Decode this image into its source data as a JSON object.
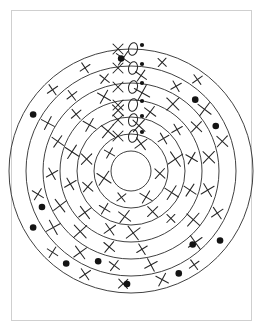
{
  "page": {
    "background_color": "#ffffff",
    "frame_color": "#cfcfcf",
    "ink_color": "#2b2b2b",
    "dot_color": "#141414",
    "width": 263,
    "height": 331
  },
  "figure": {
    "name": "concentric-rings-diagram",
    "center_x": 131,
    "center_y": 171,
    "ring_count": 6,
    "core_radius": 20,
    "ring_radii": [
      37,
      54,
      71,
      88,
      105,
      122
    ],
    "ring_labels": [
      "ring-1",
      "ring-2",
      "ring-3",
      "ring-4",
      "ring-5",
      "ring-6"
    ]
  },
  "legend_column": {
    "name": "x-o-dot-column",
    "description": "Vertical column of X, O and filled dot annotations at the top of each ring",
    "entries": [
      {
        "ring": 6,
        "x_label": "X",
        "o_label": "O",
        "dot": true,
        "y": 49
      },
      {
        "ring": 5,
        "x_label": "X",
        "o_label": "O",
        "dot": true,
        "y": 68
      },
      {
        "ring": 4,
        "x_label": "X",
        "o_label": "O",
        "dot": true,
        "y": 87
      },
      {
        "ring": 3,
        "x_label": "X",
        "o_label": "O",
        "dot": true,
        "y": 105
      },
      {
        "ring": 2,
        "x_label": "X",
        "o_label": "O",
        "dot": true,
        "y": 120
      },
      {
        "ring": 1,
        "x_label": "X",
        "o_label": "O",
        "dot": true,
        "y": 136
      }
    ]
  },
  "chart_data": {
    "type": "scatter",
    "xlabel": "",
    "ylabel": "",
    "grid": false,
    "legend": "none",
    "center": [
      131,
      171
    ],
    "ring_radii": [
      20,
      37,
      54,
      71,
      88,
      105,
      122
    ],
    "x_marks": [
      {
        "r": 28,
        "a": 200
      },
      {
        "r": 28,
        "a": 255
      },
      {
        "r": 28,
        "a": 310
      },
      {
        "r": 29,
        "a": 20
      },
      {
        "r": 29,
        "a": 95
      },
      {
        "r": 30,
        "a": 150
      },
      {
        "r": 46,
        "a": 188
      },
      {
        "r": 46,
        "a": 215
      },
      {
        "r": 46,
        "a": 250
      },
      {
        "r": 46,
        "a": 285
      },
      {
        "r": 46,
        "a": 330
      },
      {
        "r": 46,
        "a": 10
      },
      {
        "r": 46,
        "a": 45
      },
      {
        "r": 46,
        "a": 75
      },
      {
        "r": 46,
        "a": 118
      },
      {
        "r": 46,
        "a": 152
      },
      {
        "r": 62,
        "a": 178
      },
      {
        "r": 62,
        "a": 200
      },
      {
        "r": 62,
        "a": 228
      },
      {
        "r": 62,
        "a": 258
      },
      {
        "r": 62,
        "a": 288
      },
      {
        "r": 62,
        "a": 318
      },
      {
        "r": 62,
        "a": 348
      },
      {
        "r": 62,
        "a": 18
      },
      {
        "r": 62,
        "a": 48
      },
      {
        "r": 62,
        "a": 78
      },
      {
        "r": 62,
        "a": 108
      },
      {
        "r": 62,
        "a": 140
      },
      {
        "r": 79,
        "a": 172
      },
      {
        "r": 79,
        "a": 196
      },
      {
        "r": 79,
        "a": 220
      },
      {
        "r": 79,
        "a": 244
      },
      {
        "r": 79,
        "a": 268
      },
      {
        "r": 79,
        "a": 292
      },
      {
        "r": 79,
        "a": 316
      },
      {
        "r": 79,
        "a": 340
      },
      {
        "r": 79,
        "a": 8
      },
      {
        "r": 79,
        "a": 32
      },
      {
        "r": 79,
        "a": 56
      },
      {
        "r": 79,
        "a": 80
      },
      {
        "r": 79,
        "a": 104
      },
      {
        "r": 79,
        "a": 128
      },
      {
        "r": 96,
        "a": 168
      },
      {
        "r": 96,
        "a": 190
      },
      {
        "r": 96,
        "a": 212
      },
      {
        "r": 96,
        "a": 234
      },
      {
        "r": 96,
        "a": 256
      },
      {
        "r": 96,
        "a": 300
      },
      {
        "r": 96,
        "a": 322
      },
      {
        "r": 96,
        "a": 344
      },
      {
        "r": 96,
        "a": 6
      },
      {
        "r": 96,
        "a": 28
      },
      {
        "r": 96,
        "a": 50
      },
      {
        "r": 96,
        "a": 72
      },
      {
        "r": 96,
        "a": 116
      },
      {
        "r": 96,
        "a": 138
      },
      {
        "r": 113,
        "a": 164
      },
      {
        "r": 113,
        "a": 184
      },
      {
        "r": 113,
        "a": 204
      },
      {
        "r": 113,
        "a": 224
      },
      {
        "r": 113,
        "a": 316
      },
      {
        "r": 113,
        "a": 336
      },
      {
        "r": 113,
        "a": 356
      },
      {
        "r": 113,
        "a": 16
      },
      {
        "r": 113,
        "a": 36
      },
      {
        "r": 113,
        "a": 146
      }
    ],
    "dots": [
      {
        "r": 113,
        "a": 128
      },
      {
        "r": 113,
        "a": 155
      },
      {
        "r": 96,
        "a": 140
      },
      {
        "r": 113,
        "a": 182
      },
      {
        "r": 96,
        "a": 200
      },
      {
        "r": 113,
        "a": 215
      },
      {
        "r": 113,
        "a": 240
      },
      {
        "r": 96,
        "a": 248
      },
      {
        "r": 113,
        "a": 300
      },
      {
        "r": 113,
        "a": 355
      },
      {
        "r": 96,
        "a": 42
      },
      {
        "r": 96,
        "a": 62
      }
    ],
    "values": [
      6,
      12
    ],
    "categories": [
      "x-mark-count-approx",
      "dot-count"
    ]
  }
}
